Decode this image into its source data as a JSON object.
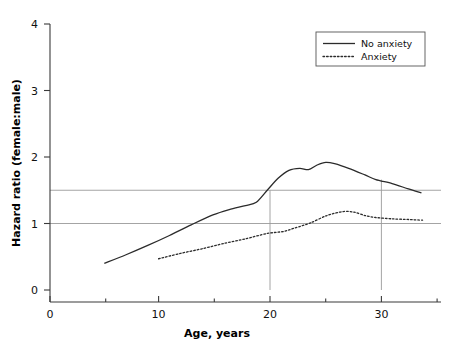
{
  "chart_data": {
    "type": "line",
    "title": "",
    "xlabel": "Age, years",
    "ylabel": "Hazard ratio (female:male)",
    "xlim": [
      0,
      36
    ],
    "ylim": [
      0,
      4
    ],
    "xticks": [
      0,
      10,
      20,
      30
    ],
    "xtick_labels": [
      "0",
      "10",
      "20",
      "30"
    ],
    "yticks": [
      0,
      1,
      2,
      3,
      4
    ],
    "ytick_labels": [
      "0",
      "1",
      "2",
      "3",
      "4"
    ],
    "grid": false,
    "legend_position": "top-right",
    "reference_lines": {
      "horizontal": [
        1.0,
        1.5
      ],
      "vertical": [
        20,
        30
      ]
    },
    "series": [
      {
        "name": "No anxiety",
        "style": "solid",
        "color": "#2b2b2b",
        "points": [
          [
            5.0,
            0.4
          ],
          [
            7.0,
            0.53
          ],
          [
            9.0,
            0.67
          ],
          [
            11.0,
            0.82
          ],
          [
            13.0,
            0.98
          ],
          [
            15.0,
            1.13
          ],
          [
            16.5,
            1.21
          ],
          [
            18.0,
            1.27
          ],
          [
            19.0,
            1.32
          ],
          [
            20.0,
            1.5
          ],
          [
            21.0,
            1.68
          ],
          [
            22.0,
            1.8
          ],
          [
            23.0,
            1.83
          ],
          [
            23.8,
            1.81
          ],
          [
            24.6,
            1.88
          ],
          [
            25.4,
            1.92
          ],
          [
            26.2,
            1.9
          ],
          [
            27.5,
            1.83
          ],
          [
            29.0,
            1.73
          ],
          [
            30.0,
            1.66
          ],
          [
            31.5,
            1.6
          ],
          [
            33.0,
            1.52
          ],
          [
            34.2,
            1.46
          ]
        ]
      },
      {
        "name": "Anxiety",
        "style": "dotted",
        "color": "#2b2b2b",
        "points": [
          [
            10.0,
            0.47
          ],
          [
            12.0,
            0.55
          ],
          [
            14.0,
            0.62
          ],
          [
            16.0,
            0.7
          ],
          [
            18.0,
            0.77
          ],
          [
            20.0,
            0.85
          ],
          [
            21.5,
            0.88
          ],
          [
            22.5,
            0.93
          ],
          [
            24.0,
            1.01
          ],
          [
            25.5,
            1.12
          ],
          [
            27.0,
            1.18
          ],
          [
            28.0,
            1.17
          ],
          [
            29.0,
            1.12
          ],
          [
            30.0,
            1.09
          ],
          [
            31.5,
            1.07
          ],
          [
            33.0,
            1.06
          ],
          [
            34.3,
            1.05
          ]
        ]
      }
    ]
  },
  "axes": {
    "y_title": "Hazard ratio (female:male)",
    "x_title": "Age, years"
  },
  "legend": {
    "entries": [
      {
        "label": "No anxiety",
        "style": "solid"
      },
      {
        "label": "Anxiety",
        "style": "dotted"
      }
    ]
  }
}
